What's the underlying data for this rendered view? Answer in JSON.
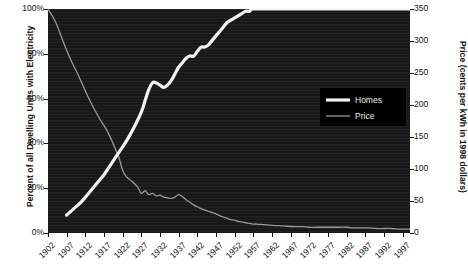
{
  "chart_data": {
    "type": "line",
    "title": "",
    "subtitle": "",
    "xlabel": "",
    "ylabel": "Percent of all Dwelling Units with Electricity",
    "y2label": "Price (cents per kWh in 1998 dollars)",
    "grid": false,
    "legend_position": "upper-right-inside",
    "background": "#171717",
    "x": [
      1902,
      1907,
      1912,
      1917,
      1922,
      1927,
      1932,
      1937,
      1942,
      1947,
      1952,
      1957,
      1962,
      1967,
      1972,
      1977,
      1982,
      1987,
      1992,
      1997
    ],
    "xlim": [
      1902,
      1999
    ],
    "xtick_labels": [
      "1902",
      "1907",
      "1912",
      "1917",
      "1922",
      "1927",
      "1932",
      "1937",
      "1942",
      "1947",
      "1952",
      "1957",
      "1962",
      "1967",
      "1972",
      "1977",
      "1982",
      "1987",
      "1992",
      "1997"
    ],
    "ylim": [
      0,
      100
    ],
    "ytick_labels": [
      "0%",
      "20%",
      "40%",
      "60%",
      "80%",
      "100%"
    ],
    "ytick_values": [
      0,
      20,
      40,
      60,
      80,
      100
    ],
    "y2lim": [
      0,
      350
    ],
    "y2tick_labels": [
      "0",
      "50",
      "100",
      "150",
      "200",
      "250",
      "300",
      "350"
    ],
    "y2tick_values": [
      0,
      50,
      100,
      150,
      200,
      250,
      300,
      350
    ],
    "series": [
      {
        "name": "Homes",
        "axis": "left",
        "color": "#f2f2f2",
        "width": 3.2,
        "unit": "percent",
        "points": [
          [
            1907,
            8
          ],
          [
            1909,
            11
          ],
          [
            1911,
            14
          ],
          [
            1913,
            18
          ],
          [
            1915,
            22
          ],
          [
            1917,
            26
          ],
          [
            1919,
            31
          ],
          [
            1921,
            36
          ],
          [
            1923,
            41
          ],
          [
            1925,
            47
          ],
          [
            1927,
            54
          ],
          [
            1928,
            59
          ],
          [
            1929,
            64
          ],
          [
            1930,
            67
          ],
          [
            1931,
            67
          ],
          [
            1932,
            66
          ],
          [
            1933,
            65
          ],
          [
            1934,
            66
          ],
          [
            1935,
            68
          ],
          [
            1936,
            71
          ],
          [
            1937,
            74
          ],
          [
            1938,
            76
          ],
          [
            1939,
            78
          ],
          [
            1940,
            79
          ],
          [
            1941,
            79
          ],
          [
            1942,
            81
          ],
          [
            1943,
            83
          ],
          [
            1944,
            83
          ],
          [
            1945,
            84
          ],
          [
            1946,
            86
          ],
          [
            1947,
            88
          ],
          [
            1948,
            90
          ],
          [
            1949,
            92
          ],
          [
            1950,
            94
          ],
          [
            1951,
            95
          ],
          [
            1952,
            96
          ],
          [
            1953,
            97
          ],
          [
            1954,
            98
          ],
          [
            1955,
            99
          ],
          [
            1956,
            99
          ],
          [
            1957,
            100
          ],
          [
            1962,
            100
          ],
          [
            1967,
            100
          ],
          [
            1972,
            100
          ],
          [
            1977,
            100
          ],
          [
            1982,
            100
          ],
          [
            1987,
            100
          ],
          [
            1992,
            100
          ],
          [
            1997,
            100
          ],
          [
            1999,
            100
          ]
        ]
      },
      {
        "name": "Price",
        "axis": "right",
        "color": "#9a9a9a",
        "width": 1.3,
        "unit": "cents per kWh (1998 dollars)",
        "points": [
          [
            1902,
            350
          ],
          [
            1904,
            330
          ],
          [
            1906,
            300
          ],
          [
            1908,
            272
          ],
          [
            1910,
            248
          ],
          [
            1912,
            222
          ],
          [
            1914,
            198
          ],
          [
            1916,
            177
          ],
          [
            1918,
            158
          ],
          [
            1920,
            132
          ],
          [
            1921,
            118
          ],
          [
            1922,
            98
          ],
          [
            1923,
            88
          ],
          [
            1924,
            83
          ],
          [
            1925,
            78
          ],
          [
            1926,
            72
          ],
          [
            1927,
            62
          ],
          [
            1928,
            66
          ],
          [
            1929,
            60
          ],
          [
            1930,
            62
          ],
          [
            1931,
            58
          ],
          [
            1932,
            59
          ],
          [
            1933,
            56
          ],
          [
            1934,
            55
          ],
          [
            1935,
            54
          ],
          [
            1936,
            56
          ],
          [
            1937,
            60
          ],
          [
            1938,
            57
          ],
          [
            1939,
            52
          ],
          [
            1940,
            48
          ],
          [
            1941,
            44
          ],
          [
            1942,
            41
          ],
          [
            1943,
            38
          ],
          [
            1944,
            36
          ],
          [
            1945,
            34
          ],
          [
            1946,
            32
          ],
          [
            1947,
            30
          ],
          [
            1948,
            27
          ],
          [
            1949,
            25
          ],
          [
            1950,
            23
          ],
          [
            1951,
            21
          ],
          [
            1952,
            20
          ],
          [
            1953,
            18
          ],
          [
            1954,
            17
          ],
          [
            1955,
            16
          ],
          [
            1956,
            15
          ],
          [
            1957,
            14
          ],
          [
            1958,
            14
          ],
          [
            1960,
            13
          ],
          [
            1962,
            12
          ],
          [
            1965,
            11
          ],
          [
            1968,
            10
          ],
          [
            1970,
            10
          ],
          [
            1972,
            9
          ],
          [
            1974,
            9
          ],
          [
            1976,
            9
          ],
          [
            1978,
            9
          ],
          [
            1980,
            9
          ],
          [
            1982,
            9
          ],
          [
            1984,
            8
          ],
          [
            1986,
            8
          ],
          [
            1988,
            8
          ],
          [
            1990,
            7
          ],
          [
            1992,
            7
          ],
          [
            1994,
            7
          ],
          [
            1996,
            6
          ],
          [
            1997,
            6
          ],
          [
            1999,
            6
          ]
        ]
      }
    ],
    "legend": [
      {
        "label": "Homes",
        "color": "#f2f2f2",
        "width": 3.2
      },
      {
        "label": "Price",
        "color": "#9a9a9a",
        "width": 1.3
      }
    ]
  }
}
